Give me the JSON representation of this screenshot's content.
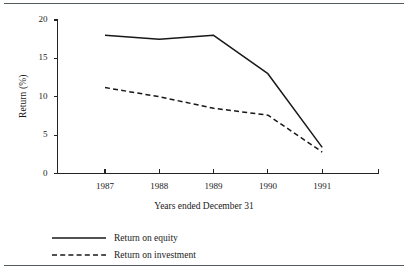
{
  "chart_data": {
    "type": "line",
    "title": "",
    "xlabel": "Years ended December 31",
    "ylabel": "Return (%)",
    "categories": [
      "1987",
      "1988",
      "1989",
      "1990",
      "1991"
    ],
    "x": [
      1987,
      1988,
      1989,
      1990,
      1991
    ],
    "xlim": [
      1986.0,
      1992.0
    ],
    "ylim": [
      0,
      20
    ],
    "yticks": [
      0,
      5,
      10,
      15,
      20
    ],
    "ytick_labels": [
      "0",
      "5",
      "10",
      "15",
      "20"
    ],
    "xtick_labels": [
      "1987",
      "1988",
      "1989",
      "1990",
      "1991"
    ],
    "grid": false,
    "legend_position": "below-plot-left",
    "series": [
      {
        "name": "Return on equity",
        "style": "solid",
        "color": "#18181a",
        "values": [
          18.0,
          17.5,
          18.0,
          13.0,
          3.4
        ]
      },
      {
        "name": "Return on investment",
        "style": "dashed",
        "color": "#18181a",
        "values": [
          11.2,
          10.0,
          8.5,
          7.6,
          2.8
        ]
      }
    ],
    "annotations": []
  },
  "figure": {
    "axis_color": "#232323",
    "rule_color": "#555c60",
    "background": "#ffffff"
  },
  "legend": {
    "items": [
      {
        "label": "Return on equity",
        "style": "solid"
      },
      {
        "label": "Return on investment",
        "style": "dashed"
      }
    ]
  }
}
